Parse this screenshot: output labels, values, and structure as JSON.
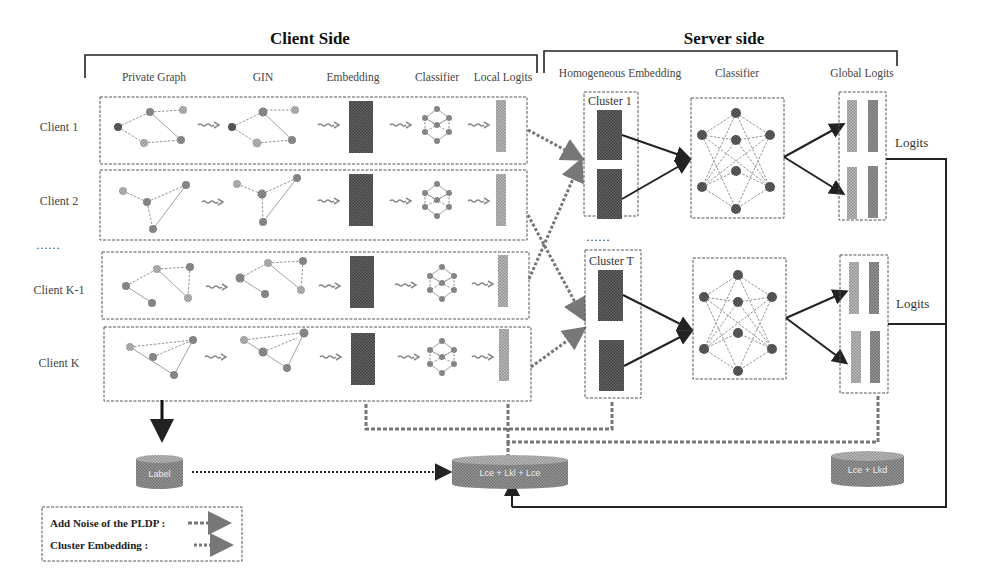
{
  "figure": {
    "client_side_title": "Client Side",
    "server_side_title": "Server side",
    "client_columns": [
      "Private Graph",
      "GIN",
      "Embedding",
      "Classifier",
      "Local Logits"
    ],
    "server_columns": [
      "Homogeneous Embedding",
      "Classifier",
      "Global Logits"
    ],
    "clients": [
      {
        "label": "Client 1"
      },
      {
        "label": "Client 2"
      },
      {
        "label": "……"
      },
      {
        "label": "Client K-1"
      },
      {
        "label": "Client K"
      }
    ],
    "clusters": [
      {
        "label": "Cluster 1"
      },
      {
        "label": "Cluster T"
      }
    ],
    "cluster_ellipsis": "……",
    "logits_labels": [
      "Logits",
      "Logits"
    ],
    "storage": {
      "label_db": "Label",
      "loss_db_main": "Lce + Lkl + Lce",
      "loss_db_server": "Lce + Lkd"
    },
    "legend": {
      "items": [
        {
          "label": "Add Noise of the PLDP :",
          "style": "noise-arrow"
        },
        {
          "label": "Cluster  Embedding :",
          "style": "cluster-arrow"
        }
      ]
    },
    "colors": {
      "embedding_dark": "#5a5a5a",
      "logit_light": "#9a9a9a",
      "node_fill": "#8a8a8a",
      "line": "#222222"
    }
  }
}
